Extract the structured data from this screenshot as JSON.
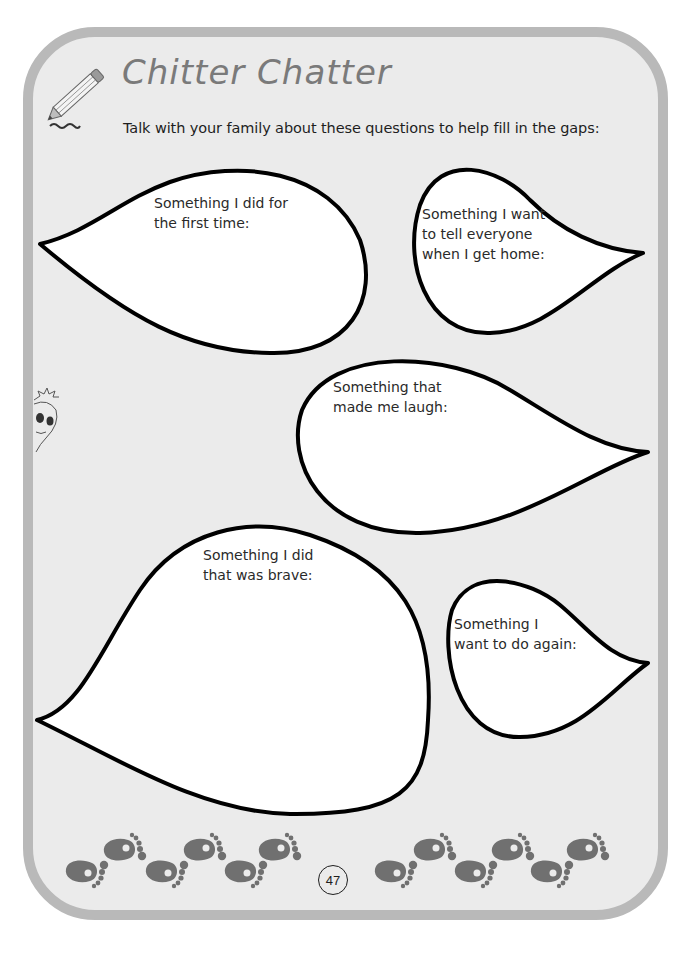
{
  "page": {
    "title": "Chitter Chatter",
    "subtitle": "Talk with your family about these questions to help fill in the gaps:",
    "page_number": "47",
    "colors": {
      "frame_border": "#b9b9b9",
      "page_background": "#ebebeb",
      "title": "#7a7a7a",
      "bubble_fill": "#ffffff",
      "bubble_outline": "#000000",
      "footprints": "#707070"
    }
  },
  "icons": {
    "pencil": "pencil-icon",
    "face": "doodle-face-icon",
    "footprint": "footprint-icon"
  },
  "bubbles": [
    {
      "id": "first-time",
      "text": "Something I did for\nthe first time:"
    },
    {
      "id": "tell-everyone",
      "text": "Something I want\nto tell everyone\nwhen I get home:"
    },
    {
      "id": "laugh",
      "text": "Something that\nmade me laugh:"
    },
    {
      "id": "brave",
      "text": "Something I did\nthat was brave:"
    },
    {
      "id": "do-again",
      "text": "Something I\nwant to do again:"
    }
  ]
}
